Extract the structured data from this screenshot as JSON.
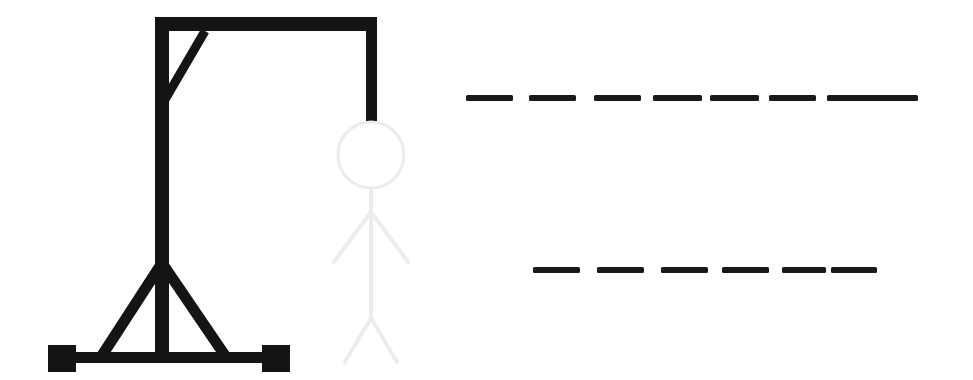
{
  "app": {
    "title": "Hangman",
    "background_color": "#ffffff"
  },
  "colors": {
    "ink": "#111111",
    "gallows": "#141414",
    "figure_revealed": "#141414",
    "figure_ghost": "#ececec",
    "blank_dash": "#1a1a1a"
  },
  "gallows": {
    "name": "gallows",
    "state_label": "complete",
    "parts": [
      {
        "name": "top-beam",
        "type": "rect",
        "x": 155,
        "y": 17,
        "w": 220,
        "h": 14,
        "label": "Top beam"
      },
      {
        "name": "vertical-post",
        "type": "rect",
        "x": 155,
        "y": 17,
        "w": 14,
        "h": 346,
        "label": "Upright post"
      },
      {
        "name": "base-beam",
        "type": "rect",
        "x": 62,
        "y": 352,
        "w": 214,
        "h": 11,
        "label": "Base beam"
      },
      {
        "name": "left-foot",
        "type": "rect",
        "x": 48,
        "y": 345,
        "w": 28,
        "h": 27,
        "label": "Left foot block"
      },
      {
        "name": "right-foot",
        "type": "rect",
        "x": 262,
        "y": 345,
        "w": 28,
        "h": 27,
        "label": "Right foot block"
      },
      {
        "name": "corner-brace",
        "type": "line",
        "x1": 205,
        "y1": 31,
        "x2": 163,
        "y2": 103,
        "w": 9,
        "label": "Corner diagonal brace"
      },
      {
        "name": "base-brace-left",
        "type": "line",
        "x1": 162,
        "y1": 263,
        "x2": 101,
        "y2": 357,
        "w": 11,
        "label": "Left A-frame brace"
      },
      {
        "name": "base-brace-right",
        "type": "line",
        "x1": 162,
        "y1": 263,
        "x2": 226,
        "y2": 357,
        "w": 11,
        "label": "Right A-frame brace"
      },
      {
        "name": "rope",
        "type": "rect",
        "x": 366,
        "y": 17,
        "w": 11,
        "h": 104,
        "label": "Rope"
      }
    ]
  },
  "figure": {
    "name": "hanged-man-figure",
    "revealed": false,
    "wrong_guesses": 0,
    "ghost_color": "#ececec",
    "parts": [
      {
        "name": "head",
        "type": "circle",
        "cx": 371,
        "cy": 155,
        "r": 33,
        "w": 3,
        "label": "Head",
        "revealed": false
      },
      {
        "name": "torso",
        "type": "line",
        "x1": 371,
        "y1": 188,
        "x2": 371,
        "y2": 318,
        "w": 4,
        "label": "Body",
        "revealed": false
      },
      {
        "name": "left-arm",
        "type": "line",
        "x1": 371,
        "y1": 212,
        "x2": 334,
        "y2": 262,
        "w": 4,
        "label": "Left arm",
        "revealed": false
      },
      {
        "name": "right-arm",
        "type": "line",
        "x1": 371,
        "y1": 212,
        "x2": 408,
        "y2": 262,
        "w": 4,
        "label": "Right arm",
        "revealed": false
      },
      {
        "name": "left-leg",
        "type": "line",
        "x1": 371,
        "y1": 318,
        "x2": 345,
        "y2": 362,
        "w": 4,
        "label": "Left leg",
        "revealed": false
      },
      {
        "name": "right-leg",
        "type": "line",
        "x1": 371,
        "y1": 318,
        "x2": 397,
        "y2": 362,
        "w": 4,
        "label": "Right leg",
        "revealed": false
      }
    ]
  },
  "puzzle": {
    "name": "answer-blanks",
    "dash_height": 6,
    "rows": [
      {
        "name": "answer-row-1",
        "y": 95,
        "letter_count": 8,
        "letters": [
          "",
          "",
          "",
          "",
          "",
          "",
          "",
          ""
        ],
        "dashes": [
          {
            "x": 466,
            "w": 47
          },
          {
            "x": 529,
            "w": 47
          },
          {
            "x": 594,
            "w": 47
          },
          {
            "x": 653,
            "w": 49
          },
          {
            "x": 710,
            "w": 49
          },
          {
            "x": 769,
            "w": 47
          },
          {
            "x": 827,
            "w": 47
          },
          {
            "x": 872,
            "w": 46
          }
        ]
      },
      {
        "name": "answer-row-2",
        "y": 267,
        "letter_count": 6,
        "letters": [
          "",
          "",
          "",
          "",
          "",
          ""
        ],
        "dashes": [
          {
            "x": 533,
            "w": 47
          },
          {
            "x": 597,
            "w": 47
          },
          {
            "x": 661,
            "w": 47
          },
          {
            "x": 722,
            "w": 47
          },
          {
            "x": 782,
            "w": 44
          },
          {
            "x": 831,
            "w": 46
          }
        ]
      }
    ]
  }
}
